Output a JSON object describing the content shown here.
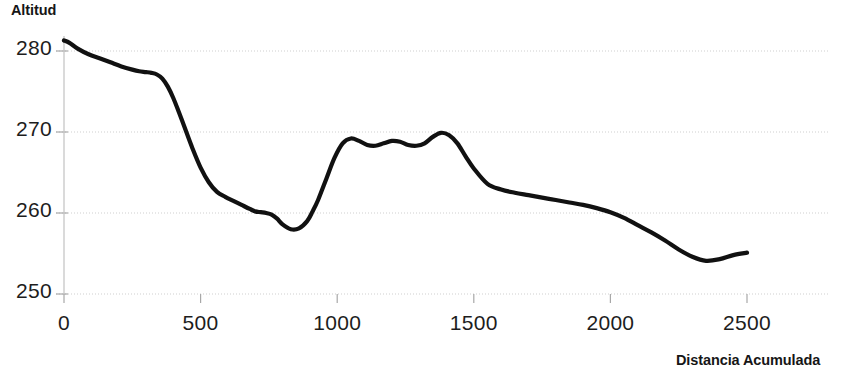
{
  "chart_data": {
    "type": "line",
    "title": "",
    "xlabel": "Distancia Acumulada",
    "ylabel": "Altitud",
    "xlim": [
      0,
      2600
    ],
    "ylim": [
      250,
      283
    ],
    "grid": true,
    "legend": null,
    "x_ticks": [
      0,
      500,
      1000,
      1500,
      2000,
      2500
    ],
    "x_tick_labels": [
      "0",
      "500",
      "1000",
      "1500",
      "2000",
      "2500"
    ],
    "y_ticks": [
      250,
      260,
      270,
      280
    ],
    "y_tick_labels": [
      "250",
      "260",
      "270",
      "280"
    ],
    "series": [
      {
        "name": "Altitud",
        "color": "#111111",
        "x": [
          0,
          20,
          50,
          90,
          130,
          170,
          210,
          250,
          275,
          300,
          320,
          340,
          360,
          380,
          400,
          420,
          440,
          470,
          500,
          530,
          560,
          590,
          620,
          650,
          680,
          700,
          720,
          740,
          760,
          780,
          800,
          830,
          860,
          890,
          910,
          930,
          960,
          990,
          1020,
          1050,
          1080,
          1110,
          1140,
          1170,
          1200,
          1230,
          1260,
          1290,
          1320,
          1350,
          1380,
          1410,
          1440,
          1470,
          1500,
          1550,
          1600,
          1650,
          1700,
          1750,
          1800,
          1850,
          1900,
          1950,
          2000,
          2050,
          2100,
          2150,
          2200,
          2250,
          2300,
          2350,
          2400,
          2450,
          2500
        ],
        "y": [
          281.3,
          281.0,
          280.3,
          279.6,
          279.1,
          278.6,
          278.1,
          277.7,
          277.5,
          277.4,
          277.3,
          277.1,
          276.6,
          275.6,
          274.2,
          272.5,
          270.7,
          268.0,
          265.6,
          263.8,
          262.6,
          262.0,
          261.5,
          261.0,
          260.5,
          260.2,
          260.1,
          260.0,
          259.8,
          259.3,
          258.6,
          258.0,
          258.1,
          259.0,
          260.2,
          261.6,
          264.2,
          266.8,
          268.6,
          269.2,
          268.9,
          268.4,
          268.3,
          268.6,
          268.9,
          268.8,
          268.4,
          268.3,
          268.6,
          269.4,
          269.9,
          269.6,
          268.6,
          267.0,
          265.5,
          263.6,
          262.9,
          262.5,
          262.2,
          261.9,
          261.6,
          261.3,
          261.0,
          260.6,
          260.1,
          259.4,
          258.5,
          257.6,
          256.6,
          255.5,
          254.6,
          254.1,
          254.3,
          254.8,
          255.1
        ]
      }
    ]
  },
  "labels": {
    "y_axis_title": "Altitud",
    "x_axis_title": "Distancia Acumulada"
  }
}
